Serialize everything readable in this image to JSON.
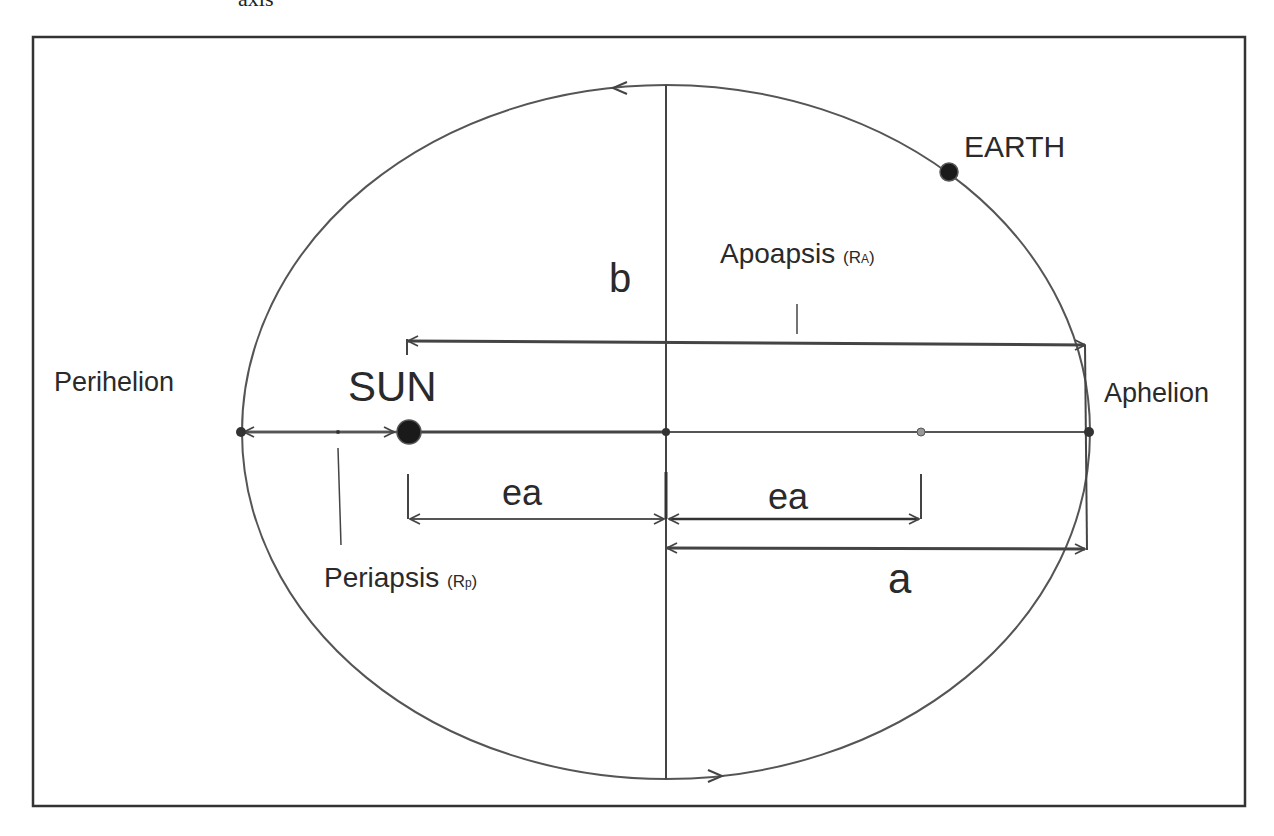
{
  "caption_fragment": "axis",
  "labels": {
    "earth": "EARTH",
    "sun": "SUN",
    "perihelion": "Perihelion",
    "aphelion": "Aphelion",
    "apoapsis": "Apoapsis",
    "apoapsis_symbol_open": "(",
    "apoapsis_symbol_main": "R",
    "apoapsis_symbol_sub": "A",
    "apoapsis_symbol_close": ")",
    "periapsis": "Periapsis",
    "periapsis_symbol_open": "(",
    "periapsis_symbol_main": "R",
    "periapsis_symbol_sub": "p",
    "periapsis_symbol_close": ")",
    "semi_minor": "b",
    "semi_major": "a",
    "focal_left": "ea",
    "focal_right": "ea"
  },
  "colors": {
    "line": "#444444",
    "frame": "#333333",
    "text": "#2a2a2a",
    "body_fill": "#1a1a1a"
  }
}
